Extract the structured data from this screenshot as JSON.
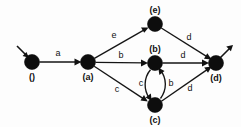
{
  "figure": {
    "type": "state-transition-diagram",
    "background_color": "#fdfdfd",
    "ink_color": "#111111",
    "width": 241,
    "height": 127
  },
  "nodes": [
    {
      "id": "start",
      "label": "()",
      "cx": 32,
      "cy": 62,
      "r": 7.5,
      "label_dx": 0,
      "label_dy": 18
    },
    {
      "id": "a",
      "label": "(a)",
      "cx": 88,
      "cy": 62,
      "r": 7.5,
      "label_dx": 0,
      "label_dy": 18
    },
    {
      "id": "e",
      "label": "(e)",
      "cx": 155,
      "cy": 24,
      "r": 7.5,
      "label_dx": 0,
      "label_dy": -11
    },
    {
      "id": "b",
      "label": "(b)",
      "cx": 155,
      "cy": 63,
      "r": 7.5,
      "label_dx": 0,
      "label_dy": -11
    },
    {
      "id": "c",
      "label": "(c)",
      "cx": 155,
      "cy": 105,
      "r": 7.5,
      "label_dx": 0,
      "label_dy": 18
    },
    {
      "id": "d",
      "label": "(d)",
      "cx": 216,
      "cy": 63,
      "r": 7.5,
      "label_dx": 0,
      "label_dy": 18
    }
  ],
  "edges": [
    {
      "id": "start-a",
      "from": "start",
      "to": "a",
      "label": "a",
      "label_x": 58,
      "label_y": 56
    },
    {
      "id": "a-e",
      "from": "a",
      "to": "e",
      "label": "e",
      "label_x": 114,
      "label_y": 38
    },
    {
      "id": "a-b",
      "from": "a",
      "to": "b",
      "label": "b",
      "label_x": 121,
      "label_y": 58
    },
    {
      "id": "a-c",
      "from": "a",
      "to": "c",
      "label": "c",
      "label_x": 117,
      "label_y": 92
    },
    {
      "id": "e-d",
      "from": "e",
      "to": "d",
      "label": "d",
      "label_x": 189,
      "label_y": 40
    },
    {
      "id": "b-d",
      "from": "b",
      "to": "d",
      "label": "d",
      "label_x": 183,
      "label_y": 58
    },
    {
      "id": "c-d",
      "from": "c",
      "to": "d",
      "label": "d",
      "label_x": 190,
      "label_y": 91
    },
    {
      "id": "b-c",
      "from": "b",
      "to": "c",
      "label": "c",
      "label_x": 141,
      "label_y": 86,
      "curved": true
    },
    {
      "id": "c-b",
      "from": "c",
      "to": "b",
      "label": "b",
      "label_x": 171,
      "label_y": 86,
      "curved": true
    }
  ],
  "terminals": {
    "entry_label": "entry-arrow",
    "exit_label": "exit-arrow"
  }
}
